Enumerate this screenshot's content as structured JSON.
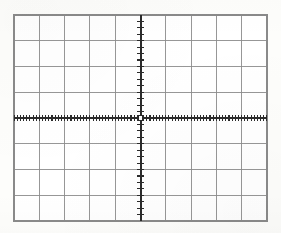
{
  "figure": {
    "name": "oscilloscope-graticule",
    "title": "",
    "background_color": "#fdfdfb",
    "width": 281,
    "height": 233
  },
  "chart_data": {
    "type": "grid",
    "title": "",
    "subtitle": "",
    "xlabel": "",
    "ylabel": "",
    "divisions_x": 10,
    "divisions_y": 8,
    "xlim": [
      -5,
      5
    ],
    "ylim": [
      -4,
      4
    ],
    "x_tick_labels": [],
    "y_tick_labels": [],
    "grid": true,
    "legend": null,
    "series": [],
    "annotations": []
  },
  "graticule": {
    "plot_area": {
      "left": 14,
      "top": 15,
      "right": 267,
      "bottom": 221,
      "width": 253,
      "height": 206
    },
    "columns": 10,
    "rows": 8,
    "cell_width": 25.3,
    "cell_height": 25.75,
    "border_color": "#8a8a8a",
    "border_width": 1.1,
    "gridline_color": "#8c8c8c",
    "gridline_width": 0.9,
    "axis": {
      "color": "#2b2b2b",
      "width": 2.0,
      "center_x": 140.5,
      "center_y": 118.0,
      "x_axis_label": "",
      "y_axis_label": ""
    },
    "minor_ticks": {
      "color": "#2b2b2b",
      "width": 1.1,
      "x_spacing": 3.16,
      "x_length": 3.2,
      "y_spacing": 6.44,
      "y_length": 3.6,
      "count_x_per_division": 8,
      "count_y_per_division": 4
    },
    "center_marker": {
      "type": "open-square",
      "size": 5,
      "color": "#2b2b2b"
    }
  }
}
